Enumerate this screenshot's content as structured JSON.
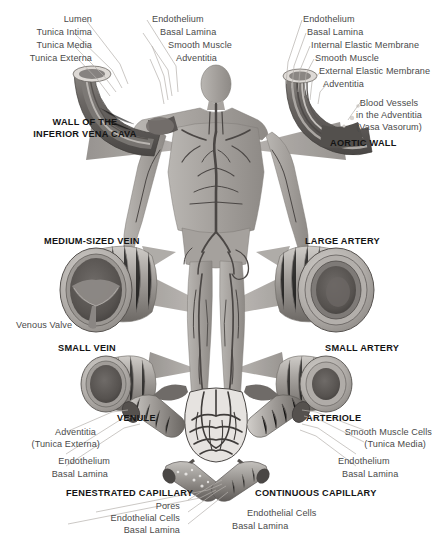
{
  "figure": {
    "palette": {
      "background": "#ffffff",
      "ink": "#231f20",
      "label_gray": "#4a4a4a",
      "tissue_light": "#c9c6c2",
      "tissue_mid": "#9b9793",
      "tissue_dark": "#6e6a67",
      "tissue_darkest": "#3f3c3a",
      "lumen": "#5d5956",
      "leader_line": "#b0acaa"
    }
  },
  "vena_cava": {
    "title": "WALL OF THE\nINFERIOR VENA CAVA",
    "title_line1": "WALL OF THE",
    "title_line2": "INFERIOR VENA CAVA",
    "layers": [
      {
        "label": "Lumen"
      },
      {
        "label": "Tunica Intima"
      },
      {
        "label": "Tunica Media"
      },
      {
        "label": "Tunica Externa"
      }
    ]
  },
  "vena_cava_detail": {
    "layers": [
      {
        "label": "Endothelium"
      },
      {
        "label": "Basal Lamina"
      },
      {
        "label": "Smooth Muscle"
      },
      {
        "label": "Adventitia"
      }
    ]
  },
  "aortic_wall": {
    "title": "AORTIC WALL",
    "layers": [
      {
        "label": "Endothelium"
      },
      {
        "label": "Basal Lamina"
      },
      {
        "label": "Internal Elastic Membrane"
      },
      {
        "label": "Smooth Muscle"
      },
      {
        "label": "External Elastic Membrane"
      },
      {
        "label": "Adventitia"
      }
    ],
    "vasa_vasorum": {
      "line1": "Blood Vessels",
      "line2": "in the Adventitia",
      "line3": "(Vasa Vasorum)"
    }
  },
  "vessels": {
    "medium_vein": {
      "title": "MEDIUM-SIZED VEIN",
      "feature": "Venous Valve"
    },
    "large_artery": {
      "title": "LARGE ARTERY"
    },
    "small_vein": {
      "title": "SMALL VEIN"
    },
    "small_artery": {
      "title": "SMALL ARTERY"
    }
  },
  "venule": {
    "title": "VENULE",
    "layers": [
      {
        "label": "Adventitia",
        "sub": "(Tunica Externa)"
      },
      {
        "label": "Endothelium"
      },
      {
        "label": "Basal Lamina"
      }
    ],
    "adventitia_line1": "Adventitia",
    "adventitia_line2": "(Tunica Externa)"
  },
  "arteriole": {
    "title": "ARTERIOLE",
    "layers": [
      {
        "label": "Smooth Muscle Cells",
        "sub": "(Tunica Media)"
      },
      {
        "label": "Endothelium"
      },
      {
        "label": "Basal Lamina"
      }
    ],
    "smooth_muscle_line1": "Smooth Muscle Cells",
    "smooth_muscle_line2": "(Tunica Media)"
  },
  "fenestrated_capillary": {
    "title": "FENESTRATED CAPILLARY",
    "layers": [
      {
        "label": "Pores"
      },
      {
        "label": "Endothelial Cells"
      },
      {
        "label": "Basal Lamina"
      }
    ]
  },
  "continuous_capillary": {
    "title": "CONTINUOUS CAPILLARY",
    "layers": [
      {
        "label": "Endothelial Cells"
      },
      {
        "label": "Basal Lamina"
      }
    ]
  }
}
